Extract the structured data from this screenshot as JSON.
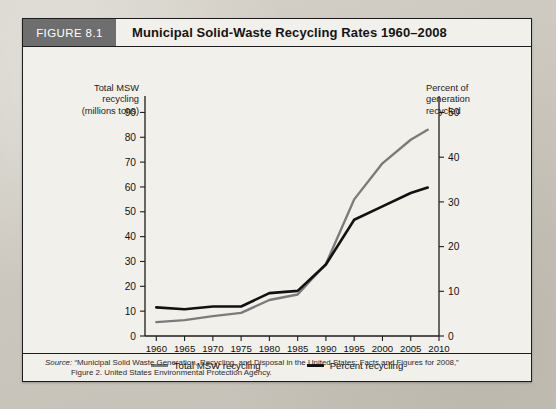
{
  "figure": {
    "tag": "FIGURE 8.1",
    "title": "Municipal Solid-Waste Recycling Rates 1960–2008"
  },
  "axes": {
    "left_caption_line1": "Total MSW",
    "left_caption_line2": "recycling",
    "left_caption_line3": "(millions tons)",
    "right_caption_line1": "Percent of",
    "right_caption_line2": "generation",
    "right_caption_line3": "recycled"
  },
  "legend": {
    "items": [
      {
        "label": "Total MSW recycling",
        "color": "#7b7b7b"
      },
      {
        "label": "Percent recycling",
        "color": "#111111"
      }
    ]
  },
  "source": {
    "label": "Source:",
    "line1": "“Municipal Solid Waste Generation, Recycling, and Disposal in the United States: Facts and Figures for 2008,”",
    "line2": "Figure 2. United States Environmental Protection Agency."
  },
  "chart_data": {
    "type": "line",
    "title": "Municipal Solid-Waste Recycling Rates 1960–2008",
    "xlabel": "",
    "ylabel": "Total MSW recycling (millions tons)",
    "y2label": "Percent of generation recycled",
    "xlim": [
      1958,
      2010
    ],
    "ylim": [
      0,
      95
    ],
    "y2lim": [
      0,
      52.8
    ],
    "grid": false,
    "legend_position": "bottom-center",
    "xticks": [
      1960,
      1965,
      1970,
      1975,
      1980,
      1985,
      1990,
      1995,
      2000,
      2005,
      2010
    ],
    "xticklabels": [
      "1960",
      "1965",
      "1970",
      "1975",
      "1980",
      "1985",
      "1990",
      "1995",
      "2000",
      "2005",
      "2010"
    ],
    "yticks": [
      0,
      10,
      20,
      30,
      40,
      50,
      60,
      70,
      80,
      90
    ],
    "yticklabels": [
      "0",
      "10",
      "20",
      "30",
      "40",
      "50",
      "60",
      "70",
      "80",
      "90"
    ],
    "y2ticks": [
      0,
      10,
      20,
      30,
      40,
      50
    ],
    "y2ticklabels": [
      "0",
      "10",
      "20",
      "30",
      "40",
      "50"
    ],
    "x": [
      1960,
      1965,
      1970,
      1975,
      1980,
      1985,
      1990,
      1995,
      2000,
      2005,
      2008
    ],
    "series": [
      {
        "name": "Total MSW recycling",
        "axis": "left",
        "units": "millions tons",
        "color": "#7b7b7b",
        "values": [
          5.6,
          6.4,
          8.0,
          9.3,
          14.5,
          16.7,
          29.0,
          55.0,
          69.5,
          79.0,
          83.0
        ]
      },
      {
        "name": "Percent recycling",
        "axis": "right",
        "units": "percent",
        "color": "#111111",
        "values": [
          6.4,
          6.0,
          6.6,
          6.6,
          9.6,
          10.1,
          16.0,
          26.0,
          29.0,
          32.0,
          33.2
        ]
      }
    ]
  }
}
